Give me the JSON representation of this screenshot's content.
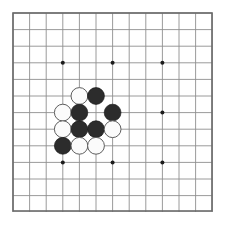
{
  "app": {
    "title": "Go Board",
    "canvas_width": 228,
    "canvas_height": 226,
    "background_color": "#ffffff"
  },
  "board": {
    "name": "go-board",
    "size": 13,
    "origin_x": 13,
    "origin_y": 13,
    "cell_size": 16.6,
    "line_color": "#8f8f8f",
    "border_color": "#6a6a6a",
    "board_color": "#ffffff",
    "star_point_color": "#1b1b1b",
    "star_point_radius": 2.0,
    "star_points": [
      {
        "col": 3,
        "row": 3
      },
      {
        "col": 6,
        "row": 3
      },
      {
        "col": 9,
        "row": 3
      },
      {
        "col": 3,
        "row": 6
      },
      {
        "col": 9,
        "row": 6
      },
      {
        "col": 3,
        "row": 9
      },
      {
        "col": 6,
        "row": 9
      },
      {
        "col": 9,
        "row": 9
      }
    ]
  },
  "stones": {
    "black_color": "#2c2c2c",
    "white_color": "#fbfbfb",
    "white_outline_color": "#5e5e5e",
    "radius": 8.4,
    "black_count": 8,
    "white_count": 8,
    "list": [
      {
        "color": "white",
        "col": 4,
        "row": 5
      },
      {
        "color": "black",
        "col": 5,
        "row": 5
      },
      {
        "color": "white",
        "col": 3,
        "row": 6
      },
      {
        "color": "black",
        "col": 4,
        "row": 6
      },
      {
        "color": "black",
        "col": 6,
        "row": 6
      },
      {
        "color": "white",
        "col": 3,
        "row": 7
      },
      {
        "color": "black",
        "col": 4,
        "row": 7
      },
      {
        "color": "black",
        "col": 5,
        "row": 7
      },
      {
        "color": "white",
        "col": 6,
        "row": 7
      },
      {
        "color": "black",
        "col": 3,
        "row": 8
      },
      {
        "color": "white",
        "col": 4,
        "row": 8
      },
      {
        "color": "white",
        "col": 5,
        "row": 8
      }
    ]
  }
}
